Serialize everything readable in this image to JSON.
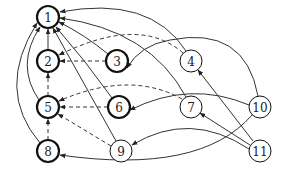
{
  "diagram": {
    "type": "directed-graph",
    "nodes": [
      {
        "id": "1",
        "label": "1",
        "x": 48,
        "y": 17,
        "bold": true
      },
      {
        "id": "2",
        "label": "2",
        "x": 48,
        "y": 61,
        "bold": true
      },
      {
        "id": "3",
        "label": "3",
        "x": 117,
        "y": 61,
        "bold": true
      },
      {
        "id": "4",
        "label": "4",
        "x": 191,
        "y": 61,
        "bold": false
      },
      {
        "id": "5",
        "label": "5",
        "x": 48,
        "y": 107,
        "bold": true
      },
      {
        "id": "6",
        "label": "6",
        "x": 119,
        "y": 107,
        "bold": true
      },
      {
        "id": "7",
        "label": "7",
        "x": 191,
        "y": 107,
        "bold": false
      },
      {
        "id": "8",
        "label": "8",
        "x": 48,
        "y": 151,
        "bold": true
      },
      {
        "id": "9",
        "label": "9",
        "x": 121,
        "y": 151,
        "bold": false
      },
      {
        "id": "10",
        "label": "10",
        "x": 260,
        "y": 107,
        "bold": false
      },
      {
        "id": "11",
        "label": "11",
        "x": 260,
        "y": 151,
        "bold": false
      }
    ],
    "edges": [
      {
        "from": "2",
        "to": "1",
        "style": "solid"
      },
      {
        "from": "3",
        "to": "1",
        "style": "solid"
      },
      {
        "from": "4",
        "to": "1",
        "style": "solid"
      },
      {
        "from": "5",
        "to": "1",
        "style": "solid"
      },
      {
        "from": "6",
        "to": "1",
        "style": "solid"
      },
      {
        "from": "7",
        "to": "1",
        "style": "solid"
      },
      {
        "from": "8",
        "to": "1",
        "style": "solid"
      },
      {
        "from": "9",
        "to": "1",
        "style": "solid"
      },
      {
        "from": "3",
        "to": "2",
        "style": "dashed"
      },
      {
        "from": "4",
        "to": "2",
        "style": "dashed"
      },
      {
        "from": "5",
        "to": "2",
        "style": "dashed"
      },
      {
        "from": "6",
        "to": "5",
        "style": "dashed"
      },
      {
        "from": "7",
        "to": "5",
        "style": "dashed"
      },
      {
        "from": "8",
        "to": "5",
        "style": "dashed"
      },
      {
        "from": "9",
        "to": "5",
        "style": "dashed"
      },
      {
        "from": "10",
        "to": "3",
        "style": "solid"
      },
      {
        "from": "10",
        "to": "6",
        "style": "solid"
      },
      {
        "from": "10",
        "to": "8",
        "style": "solid"
      },
      {
        "from": "11",
        "to": "4",
        "style": "solid"
      },
      {
        "from": "11",
        "to": "7",
        "style": "solid"
      },
      {
        "from": "11",
        "to": "9",
        "style": "solid"
      }
    ]
  }
}
